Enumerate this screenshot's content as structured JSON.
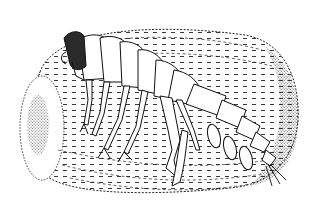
{
  "figure": {
    "style": "black-and-white stippled scientific line drawing",
    "background_color": "#ffffff",
    "ink_color": "#111111",
    "head_fill_color": "#2a2a2a",
    "parts": {
      "tube": "tube-icon",
      "body": "amphipod-body-icon",
      "head": "head-icon",
      "legs": "legs-icon",
      "urosome": "tail-icon"
    }
  }
}
